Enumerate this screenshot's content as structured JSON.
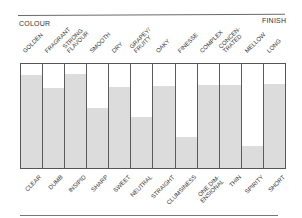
{
  "chart_data": {
    "type": "bar",
    "title": "",
    "left_header": "COLOUR",
    "right_header": "FINISH",
    "xlabel": "",
    "ylabel": "",
    "ylim": [
      0,
      100
    ],
    "grid": false,
    "fill_color": "#dcdcdc",
    "line_color": "#555555",
    "categories": [
      {
        "top": "GOLDEN",
        "bottom": "CLEAR",
        "value": 89
      },
      {
        "top": "FRAGRANT",
        "bottom": "DUMB",
        "value": 77
      },
      {
        "top": "STRONG\nFLAVOUR",
        "bottom": "INSIPID",
        "value": 90
      },
      {
        "top": "SMOOTH",
        "bottom": "SHARP",
        "value": 58
      },
      {
        "top": "DRY",
        "bottom": "SWEET",
        "value": 78
      },
      {
        "top": "GRAPEY/\nFRUITY",
        "bottom": "NEUTRAL",
        "value": 49
      },
      {
        "top": "OAKY",
        "bottom": "STRAIGHT",
        "value": 79
      },
      {
        "top": "FINESSE",
        "bottom": "CLUMSINESS",
        "value": 30
      },
      {
        "top": "COMPLEX",
        "bottom": "ONE DIM-\nENSIONAL",
        "value": 80
      },
      {
        "top": "CONCEN-\nTRATED",
        "bottom": "THIN",
        "value": 80
      },
      {
        "top": "MELLOW",
        "bottom": "SPIRITY",
        "value": 21
      },
      {
        "top": "LONG",
        "bottom": "SHORT",
        "value": 81
      }
    ],
    "values": [
      89,
      77,
      90,
      58,
      78,
      49,
      79,
      30,
      80,
      80,
      21,
      81
    ]
  }
}
